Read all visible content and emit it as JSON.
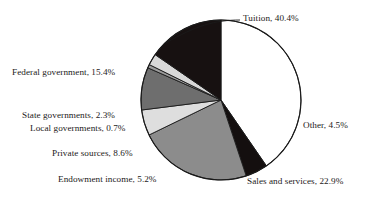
{
  "chart_data": {
    "type": "pie",
    "title": "",
    "subtitle": "",
    "xlabel": "",
    "ylabel": "",
    "legend_position": "none",
    "grid": false,
    "units": "percent",
    "start_angle_deg": 0,
    "direction": "clockwise",
    "center": {
      "x": 221,
      "y": 100
    },
    "radius": 80,
    "categories": [
      "Tuition",
      "Other",
      "Sales and services",
      "Endowment income",
      "Private sources",
      "Local governments",
      "State governments",
      "Federal government"
    ],
    "values": [
      40.4,
      4.5,
      22.9,
      5.2,
      8.6,
      0.7,
      2.3,
      15.4
    ],
    "slices": [
      {
        "name": "Tuition",
        "value": 40.4,
        "label": "Tuition, 40.4%",
        "color": "#ffffff",
        "stroke": "#1a1a1a"
      },
      {
        "name": "Other",
        "value": 4.5,
        "label": "Other, 4.5%",
        "color": "#140f0f",
        "stroke": "#1a1a1a"
      },
      {
        "name": "Sales and services",
        "value": 22.9,
        "label": "Sales and services, 22.9%",
        "color": "#8c8c8c",
        "stroke": "#1a1a1a"
      },
      {
        "name": "Endowment income",
        "value": 5.2,
        "label": "Endowment income, 5.2%",
        "color": "#dedede",
        "stroke": "#1a1a1a"
      },
      {
        "name": "Private sources",
        "value": 8.6,
        "label": "Private sources, 8.6%",
        "color": "#6e6e6e",
        "stroke": "#1a1a1a"
      },
      {
        "name": "Local governments",
        "value": 0.7,
        "label": "Local governments, 0.7%",
        "color": "#9b9b9b",
        "stroke": "#1a1a1a"
      },
      {
        "name": "State governments",
        "value": 2.3,
        "label": "State governments, 2.3%",
        "color": "#d8d8d8",
        "stroke": "#1a1a1a"
      },
      {
        "name": "Federal government",
        "value": 15.4,
        "label": "Federal government, 15.4%",
        "color": "#171111",
        "stroke": "#1a1a1a"
      }
    ]
  },
  "labels": {
    "tuition": "Tuition, 40.4%",
    "federal_government": "Federal government, 15.4%",
    "state_governments": "State governments, 2.3%",
    "local_governments": "Local governments, 0.7%",
    "private_sources": "Private sources, 8.6%",
    "endowment_income": "Endowment income, 5.2%",
    "sales_and_services": "Sales and services, 22.9%",
    "other": "Other, 4.5%"
  },
  "colors": {
    "background": "#ffffff",
    "outline": "#1a1a1a",
    "text": "#1d1a1a"
  }
}
